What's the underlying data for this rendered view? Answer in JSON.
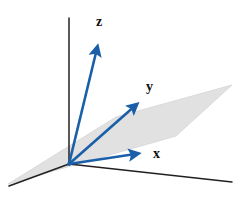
{
  "figure": {
    "width": 233,
    "height": 198,
    "background_color": "#ffffff"
  },
  "colors": {
    "vector_blue": "#1a5fa8",
    "axis_black": "#231f20",
    "plane_gray": "#e1e1e1",
    "plane_edge_gray": "#d4d4d4",
    "label_text": "#111111"
  },
  "geometry": {
    "origin": {
      "x": 69,
      "y": 164
    },
    "plane_polygon": [
      {
        "x": 8,
        "y": 184
      },
      {
        "x": 116,
        "y": 117
      },
      {
        "x": 232,
        "y": 85
      },
      {
        "x": 176,
        "y": 136
      }
    ],
    "axes": [
      {
        "name": "vertical-axis-line",
        "from": {
          "x": 69,
          "y": 164
        },
        "to": {
          "x": 69,
          "y": 18
        }
      },
      {
        "name": "left-axis-line",
        "from": {
          "x": 69,
          "y": 164
        },
        "to": {
          "x": 9,
          "y": 186
        }
      },
      {
        "name": "right-axis-line",
        "from": {
          "x": 69,
          "y": 164
        },
        "to": {
          "x": 232,
          "y": 182
        }
      }
    ],
    "vectors": [
      {
        "id": "vector-z",
        "label": "z",
        "from": {
          "x": 69,
          "y": 164
        },
        "to": {
          "x": 100,
          "y": 36
        },
        "label_position": {
          "x": 96,
          "y": 15
        }
      },
      {
        "id": "vector-y",
        "label": "y",
        "from": {
          "x": 69,
          "y": 164
        },
        "to": {
          "x": 145,
          "y": 97
        },
        "label_position": {
          "x": 146,
          "y": 80
        }
      },
      {
        "id": "vector-x",
        "label": "x",
        "from": {
          "x": 69,
          "y": 164
        },
        "to": {
          "x": 149,
          "y": 152
        },
        "label_position": {
          "x": 153,
          "y": 147
        }
      }
    ]
  },
  "labels": {
    "z": "z",
    "y": "y",
    "x": "x"
  }
}
